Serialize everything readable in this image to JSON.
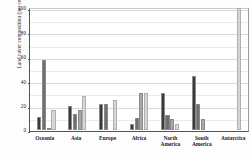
{
  "chart_data": {
    "type": "bar",
    "title": "",
    "xlabel": "",
    "ylabel": "Land cover composition (per cent)",
    "ylim": [
      0,
      100
    ],
    "yticks": [
      0,
      20,
      40,
      60,
      80,
      100
    ],
    "ytick_labels": [
      "0",
      "20",
      "40",
      "60",
      "80",
      "100"
    ],
    "grid": true,
    "legend": "none",
    "categories": [
      "Oceania",
      "Asia",
      "Europe",
      "Africa",
      "North America",
      "South America",
      "Antarctica"
    ],
    "category_lines": [
      [
        "Oceania"
      ],
      [
        "Asia"
      ],
      [
        "Europe"
      ],
      [
        "Africa"
      ],
      [
        "North",
        "America"
      ],
      [
        "South",
        "America"
      ],
      [
        "Antarctica"
      ]
    ],
    "series": [
      {
        "name": "Series 1",
        "color": "#3a3a3a",
        "values": [
          11,
          20,
          21,
          5,
          30,
          44,
          0
        ]
      },
      {
        "name": "Series 2",
        "color": "#6e6e6e",
        "values": [
          57,
          13,
          21,
          10,
          12,
          21,
          0
        ]
      },
      {
        "name": "Series 3",
        "color": "#a8a8a8",
        "values": [
          1,
          16,
          0,
          30,
          9,
          9,
          0
        ]
      },
      {
        "name": "Series 4",
        "color": "#d6d6d6",
        "values": [
          16,
          28,
          25,
          30,
          5,
          0,
          100
        ]
      }
    ]
  }
}
